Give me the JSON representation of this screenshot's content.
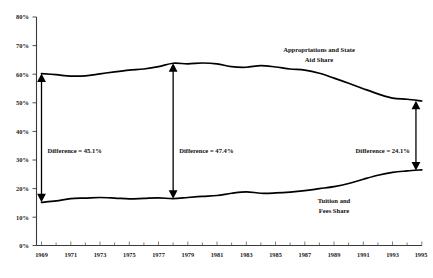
{
  "chart_data": {
    "type": "line",
    "title": "",
    "subtitle": "",
    "xlabel": "",
    "ylabel": "",
    "xlim": [
      1969,
      1995
    ],
    "ylim": [
      0,
      80
    ],
    "grid": false,
    "legend_position": "inline-annotations",
    "x": [
      1969,
      1970,
      1971,
      1972,
      1973,
      1974,
      1975,
      1976,
      1977,
      1978,
      1979,
      1980,
      1981,
      1982,
      1983,
      1984,
      1985,
      1986,
      1987,
      1988,
      1989,
      1990,
      1991,
      1992,
      1993,
      1994,
      1995
    ],
    "xtick_labels": [
      "1969",
      "1971",
      "1973",
      "1975",
      "1977",
      "1979",
      "1981",
      "1983",
      "1985",
      "1987",
      "1989",
      "1991",
      "1993",
      "1995"
    ],
    "ytick_labels": [
      "0%",
      "10%",
      "20%",
      "30%",
      "40%",
      "50%",
      "60%",
      "70%",
      "80%"
    ],
    "ytick_values": [
      0,
      10,
      20,
      30,
      40,
      50,
      60,
      70,
      80
    ],
    "series": [
      {
        "name": "Appropriations and State Aid Share",
        "label_line1": "Appropriations and State",
        "label_line2": "Aid Share",
        "color": "#000000",
        "values": [
          60.2,
          59.8,
          59.3,
          59.4,
          60.1,
          60.8,
          61.4,
          61.8,
          62.6,
          63.8,
          63.6,
          63.9,
          63.6,
          62.6,
          62.4,
          63.0,
          62.5,
          61.8,
          61.4,
          60.3,
          58.6,
          56.8,
          54.9,
          53.1,
          51.6,
          51.2,
          50.6
        ]
      },
      {
        "name": "Tuition and Fees Share",
        "label_line1": "Tuition and",
        "label_line2": "Fees Share",
        "color": "#000000",
        "values": [
          15.1,
          15.6,
          16.4,
          16.6,
          16.8,
          16.6,
          16.3,
          16.5,
          16.7,
          16.4,
          16.8,
          17.2,
          17.5,
          18.3,
          18.8,
          18.3,
          18.4,
          18.7,
          19.2,
          19.9,
          20.6,
          21.7,
          23.2,
          24.6,
          25.6,
          26.1,
          26.5
        ]
      }
    ],
    "annotations": [
      {
        "name": "difference-1969",
        "label": "Difference = 45.1%",
        "x": 1969,
        "y_top": 60.2,
        "y_bottom": 15.1,
        "value": 45.1
      },
      {
        "name": "difference-1978",
        "label": "Difference = 47.4%",
        "x": 1978,
        "y_top": 63.8,
        "y_bottom": 16.4,
        "value": 47.4
      },
      {
        "name": "difference-1995",
        "label": "Difference = 24.1%",
        "x": 1994.6,
        "y_top": 50.7,
        "y_bottom": 26.3,
        "value": 24.1
      }
    ]
  }
}
